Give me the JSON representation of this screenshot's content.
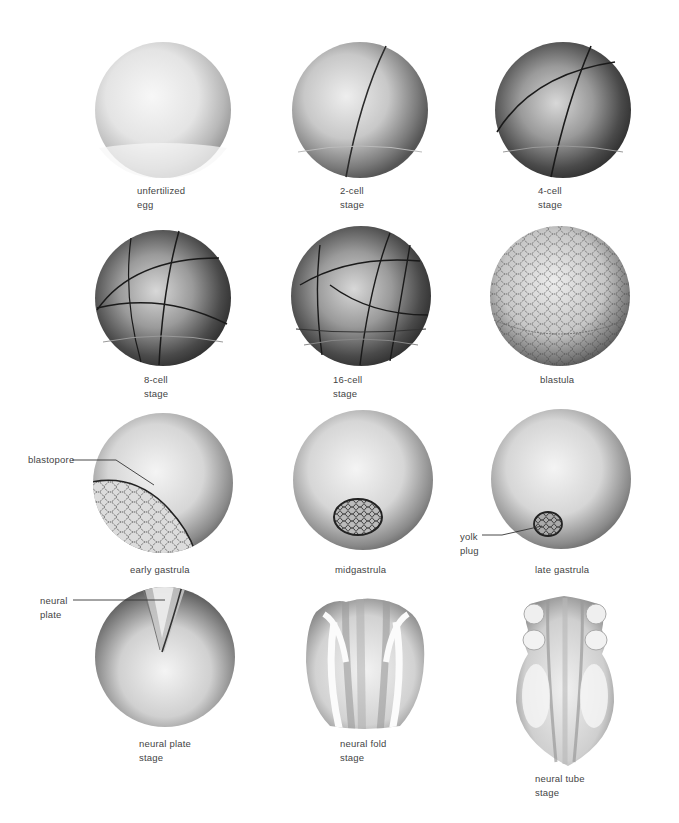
{
  "figure": {
    "stages": [
      {
        "id": "unfertilized-egg",
        "label": "unfertilized\negg"
      },
      {
        "id": "2-cell-stage",
        "label": "2-cell\nstage"
      },
      {
        "id": "4-cell-stage",
        "label": "4-cell\nstage"
      },
      {
        "id": "8-cell-stage",
        "label": "8-cell\nstage"
      },
      {
        "id": "16-cell-stage",
        "label": "16-cell\nstage"
      },
      {
        "id": "blastula",
        "label": "blastula"
      },
      {
        "id": "early-gastrula",
        "label": "early gastrula"
      },
      {
        "id": "midgastrula",
        "label": "midgastrula"
      },
      {
        "id": "late-gastrula",
        "label": "late gastrula"
      },
      {
        "id": "neural-plate-stage",
        "label": "neural plate\nstage"
      },
      {
        "id": "neural-fold-stage",
        "label": "neural fold\nstage"
      },
      {
        "id": "neural-tube-stage",
        "label": "neural tube\nstage"
      }
    ],
    "callouts": {
      "blastopore": "blastopore",
      "yolk_plug": "yolk\nplug",
      "neural_plate": "neural\nplate"
    },
    "colors": {
      "background": "#ffffff",
      "shade_dark": "#2b2b2b",
      "shade_mid": "#8a8a8a",
      "shade_light": "#f2f2f2",
      "label_text": "#444444"
    }
  }
}
